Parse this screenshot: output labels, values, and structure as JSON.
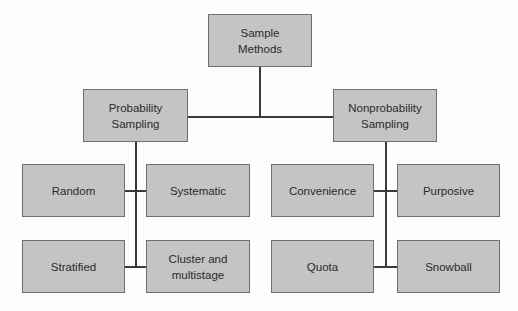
{
  "diagram": {
    "root": {
      "label_line1": "Sample",
      "label_line2": "Methods"
    },
    "probability": {
      "label_line1": "Probability",
      "label_line2": "Sampling",
      "children": [
        "Random",
        "Systematic",
        "Stratified",
        "Cluster and multistage"
      ]
    },
    "nonprobability": {
      "label_line1": "Nonprobability",
      "label_line2": "Sampling",
      "children": [
        "Convenience",
        "Purposive",
        "Quota",
        "Snowball"
      ]
    }
  },
  "colors": {
    "box_fill": "#c4c4c4",
    "box_border": "#6e6e6e",
    "line": "#3a3a3a"
  }
}
